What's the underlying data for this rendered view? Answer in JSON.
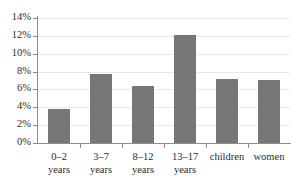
{
  "chart_data": {
    "type": "bar",
    "title": "",
    "subtitle": "",
    "xlabel": "",
    "ylabel": "",
    "categories": [
      "0–2 years",
      "3–7 years",
      "8–12 years",
      "13–17 years",
      "children",
      "women"
    ],
    "category_lines": [
      [
        "0–2",
        "years"
      ],
      [
        "3–7",
        "years"
      ],
      [
        "8–12",
        "years"
      ],
      [
        "13–17",
        "years"
      ],
      [
        "children",
        ""
      ],
      [
        "women",
        ""
      ]
    ],
    "values": [
      3.8,
      7.7,
      6.4,
      12.1,
      7.2,
      7.1
    ],
    "value_labels": [
      "3.8%",
      "7.7%",
      "6.4%",
      "12.1%",
      "7.2%",
      "7.1%"
    ],
    "ylim": [
      0,
      14
    ],
    "yticks": [
      0,
      2,
      4,
      6,
      8,
      10,
      12,
      14
    ],
    "ytick_labels": [
      "0%",
      "2%",
      "4%",
      "6%",
      "8%",
      "10%",
      "12%",
      "14%"
    ],
    "grid": true,
    "legend": false,
    "legend_position": "none",
    "bar_color": "#767676",
    "gridline_color": "#e8e8e8",
    "axis_color": "#8c8c8c",
    "text_color": "#2b2b2b",
    "background_color": "#ffffff"
  }
}
